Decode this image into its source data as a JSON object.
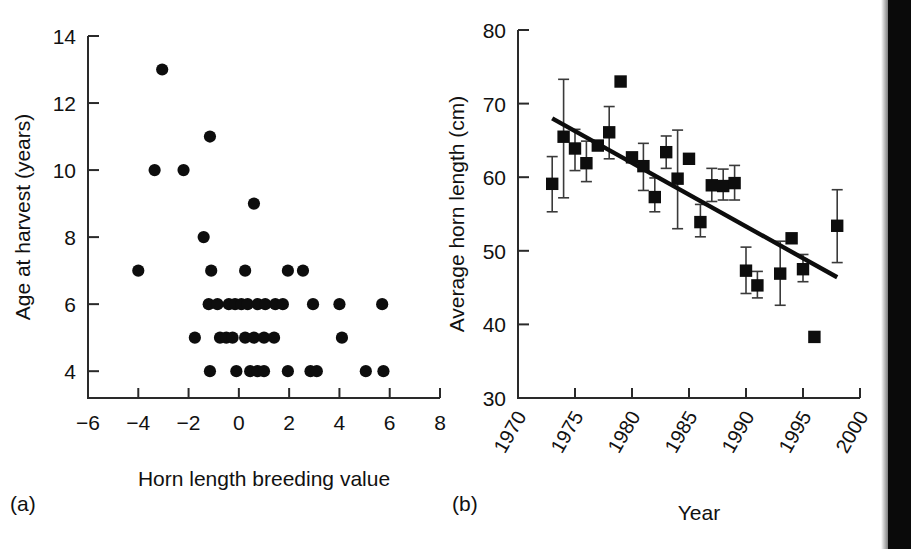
{
  "figure": {
    "panel_a_caption": "(a)",
    "panel_b_caption": "(b)"
  },
  "chart_data": [
    {
      "id": "panel-a",
      "type": "scatter",
      "title": "",
      "xlabel": "Horn length breeding value",
      "ylabel": "Age at harvest (years)",
      "xlim": [
        -6,
        8
      ],
      "ylim": [
        3.2,
        14
      ],
      "xticks": [
        -6,
        -4,
        -2,
        0,
        2,
        4,
        6,
        8
      ],
      "xticklabels": [
        "−6",
        "−4",
        "−2",
        "0",
        "2",
        "4",
        "6",
        "8"
      ],
      "yticks": [
        4,
        6,
        8,
        10,
        12,
        14
      ],
      "yticklabels": [
        "4",
        "6",
        "8",
        "10",
        "12",
        "14"
      ],
      "grid": false,
      "legend": "none",
      "marker": "circle-filled",
      "points": [
        {
          "x": -3.05,
          "y": 13
        },
        {
          "x": -1.15,
          "y": 11
        },
        {
          "x": -3.35,
          "y": 10
        },
        {
          "x": -2.2,
          "y": 10
        },
        {
          "x": 0.6,
          "y": 9
        },
        {
          "x": -1.4,
          "y": 8
        },
        {
          "x": -4.0,
          "y": 7
        },
        {
          "x": -1.1,
          "y": 7
        },
        {
          "x": 0.25,
          "y": 7
        },
        {
          "x": 1.95,
          "y": 7
        },
        {
          "x": 2.55,
          "y": 7
        },
        {
          "x": -1.2,
          "y": 6
        },
        {
          "x": -0.85,
          "y": 6
        },
        {
          "x": -0.4,
          "y": 6
        },
        {
          "x": -0.15,
          "y": 6
        },
        {
          "x": 0.1,
          "y": 6
        },
        {
          "x": 0.35,
          "y": 6
        },
        {
          "x": 0.75,
          "y": 6
        },
        {
          "x": 1.05,
          "y": 6
        },
        {
          "x": 1.45,
          "y": 6
        },
        {
          "x": 1.75,
          "y": 6
        },
        {
          "x": 2.95,
          "y": 6
        },
        {
          "x": 4.0,
          "y": 6
        },
        {
          "x": 5.7,
          "y": 6
        },
        {
          "x": -1.75,
          "y": 5
        },
        {
          "x": -0.75,
          "y": 5
        },
        {
          "x": -0.5,
          "y": 5
        },
        {
          "x": -0.25,
          "y": 5
        },
        {
          "x": 0.25,
          "y": 5
        },
        {
          "x": 0.6,
          "y": 5
        },
        {
          "x": 1.0,
          "y": 5
        },
        {
          "x": 1.4,
          "y": 5
        },
        {
          "x": 4.1,
          "y": 5
        },
        {
          "x": -1.15,
          "y": 4
        },
        {
          "x": -0.1,
          "y": 4
        },
        {
          "x": 0.45,
          "y": 4
        },
        {
          "x": 0.75,
          "y": 4
        },
        {
          "x": 1.0,
          "y": 4
        },
        {
          "x": 1.95,
          "y": 4
        },
        {
          "x": 2.85,
          "y": 4
        },
        {
          "x": 3.1,
          "y": 4
        },
        {
          "x": 5.05,
          "y": 4
        },
        {
          "x": 5.75,
          "y": 4
        }
      ]
    },
    {
      "id": "panel-b",
      "type": "scatter",
      "title": "",
      "xlabel": "Year",
      "ylabel": "Average horn length (cm)",
      "xlim": [
        1970,
        2000
      ],
      "ylim": [
        30,
        80
      ],
      "xticks": [
        1970,
        1975,
        1980,
        1985,
        1990,
        1995,
        2000
      ],
      "xticklabels": [
        "1970",
        "1975",
        "1980",
        "1985",
        "1990",
        "1995",
        "2000"
      ],
      "yticks": [
        30,
        40,
        50,
        60,
        70,
        80
      ],
      "yticklabels": [
        "30",
        "40",
        "50",
        "60",
        "70",
        "80"
      ],
      "grid": false,
      "legend": "none",
      "marker": "square-filled",
      "errorbars": true,
      "points": [
        {
          "x": 1973,
          "y": 59.1,
          "yerr_low": 55.3,
          "yerr_high": 62.8
        },
        {
          "x": 1974,
          "y": 65.5,
          "yerr_low": 57.2,
          "yerr_high": 73.3
        },
        {
          "x": 1975,
          "y": 63.9,
          "yerr_low": 60.9,
          "yerr_high": 66.5
        },
        {
          "x": 1976,
          "y": 61.9,
          "yerr_low": 59.4,
          "yerr_high": 64.9
        },
        {
          "x": 1977,
          "y": 64.3,
          "yerr_low": null,
          "yerr_high": null
        },
        {
          "x": 1978,
          "y": 66.1,
          "yerr_low": 62.5,
          "yerr_high": 69.6
        },
        {
          "x": 1979,
          "y": 73.0,
          "yerr_low": null,
          "yerr_high": null
        },
        {
          "x": 1980,
          "y": 62.7,
          "yerr_low": null,
          "yerr_high": null
        },
        {
          "x": 1981,
          "y": 61.5,
          "yerr_low": 58.2,
          "yerr_high": 64.6
        },
        {
          "x": 1982,
          "y": 57.3,
          "yerr_low": 55.3,
          "yerr_high": 59.9
        },
        {
          "x": 1983,
          "y": 63.4,
          "yerr_low": 61.2,
          "yerr_high": 65.6
        },
        {
          "x": 1984,
          "y": 59.8,
          "yerr_low": 53.0,
          "yerr_high": 66.4
        },
        {
          "x": 1985,
          "y": 62.5,
          "yerr_low": null,
          "yerr_high": null
        },
        {
          "x": 1986,
          "y": 53.9,
          "yerr_low": 51.9,
          "yerr_high": 56.3
        },
        {
          "x": 1987,
          "y": 58.9,
          "yerr_low": 56.7,
          "yerr_high": 61.2
        },
        {
          "x": 1988,
          "y": 58.8,
          "yerr_low": 56.9,
          "yerr_high": 61.1
        },
        {
          "x": 1989,
          "y": 59.2,
          "yerr_low": 56.9,
          "yerr_high": 61.6
        },
        {
          "x": 1990,
          "y": 47.3,
          "yerr_low": 44.2,
          "yerr_high": 50.5
        },
        {
          "x": 1991,
          "y": 45.3,
          "yerr_low": 43.6,
          "yerr_high": 47.2
        },
        {
          "x": 1993,
          "y": 46.9,
          "yerr_low": 42.6,
          "yerr_high": 51.3
        },
        {
          "x": 1994,
          "y": 51.7,
          "yerr_low": null,
          "yerr_high": null
        },
        {
          "x": 1995,
          "y": 47.5,
          "yerr_low": 45.8,
          "yerr_high": 49.5
        },
        {
          "x": 1996,
          "y": 38.3,
          "yerr_low": null,
          "yerr_high": null
        },
        {
          "x": 1998,
          "y": 53.4,
          "yerr_low": 48.4,
          "yerr_high": 58.3
        }
      ],
      "trendline": {
        "x0": 1973.0,
        "y0": 68.0,
        "x1": 1998.0,
        "y1": 46.4
      }
    }
  ]
}
